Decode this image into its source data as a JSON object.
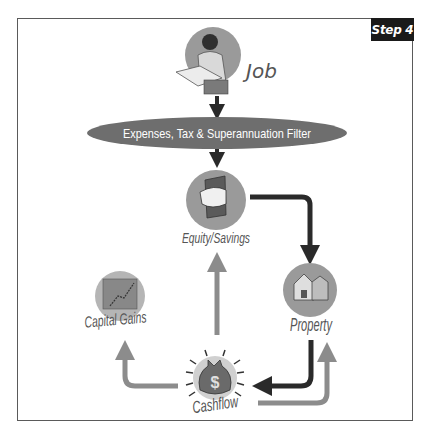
{
  "step_badge": "Step 4",
  "nodes": {
    "job": {
      "label": "Job",
      "icon": "person-at-desk-icon"
    },
    "filter": {
      "label": "Expenses, Tax & Superannuation Filter"
    },
    "equity": {
      "label": "Equity/Savings",
      "icon": "hand-holding-money-icon"
    },
    "property": {
      "label": "Property",
      "icon": "house-icon"
    },
    "capital_gains": {
      "label": "Capital Gains",
      "icon": "rising-chart-icon"
    },
    "cashflow": {
      "label": "Cashflow",
      "icon": "money-bag-icon"
    }
  },
  "colors": {
    "dark_arrow": "#2a2a2a",
    "light_arrow": "#8c8c8c",
    "circle_fill": "#9a9a9a",
    "ellipse_fill": "#6e6e6e",
    "label": "#555555",
    "frame": "#5a5a5a",
    "badge_bg": "#1a1a1a"
  },
  "edges": [
    {
      "from": "Job",
      "to": "Filter",
      "style": "dark"
    },
    {
      "from": "Filter",
      "to": "Equity/Savings",
      "style": "dark"
    },
    {
      "from": "Equity/Savings",
      "to": "Property",
      "style": "dark"
    },
    {
      "from": "Property",
      "to": "Cashflow",
      "style": "dark"
    },
    {
      "from": "Cashflow",
      "to": "Property",
      "style": "light"
    },
    {
      "from": "Cashflow",
      "to": "Equity/Savings",
      "style": "light"
    },
    {
      "from": "Cashflow",
      "to": "Capital Gains",
      "style": "light"
    }
  ]
}
